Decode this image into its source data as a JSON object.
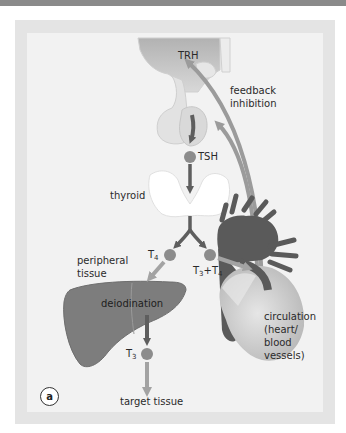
{
  "figure": {
    "panel_label": "a",
    "labels": {
      "trh": "TRH",
      "feedback": "feedback",
      "inhibition": "inhibition",
      "tsh": "TSH",
      "thyroid": "thyroid",
      "peripheral": "peripheral",
      "tissue": "tissue",
      "t4_letter": "T",
      "t4_sub": "4",
      "t3t4_a": "T",
      "t3t4_a_sub": "3",
      "t3t4_plus": "+T",
      "t3t4_b_sub": "4",
      "deiodination": "deiodination",
      "t3_letter": "T",
      "t3_sub": "3",
      "circ1": "circulation",
      "circ2": "(heart/",
      "circ3": "blood",
      "circ4": "vessels)",
      "target": "target tissue"
    },
    "colors": {
      "hormone_circle": "#8c8c8c",
      "dark_arrow": "#5e5e5e",
      "light_arrow": "#a3a3a3",
      "feedback_arrow": "#9b9b9b",
      "liver": "#7d7d7d",
      "heart_dark": "#5a5a5a",
      "heart_light": "#cfcfcf",
      "hypothalamus": "#bdbdbd",
      "pituitary": "#dedede",
      "thyroid": "#ffffff"
    }
  }
}
